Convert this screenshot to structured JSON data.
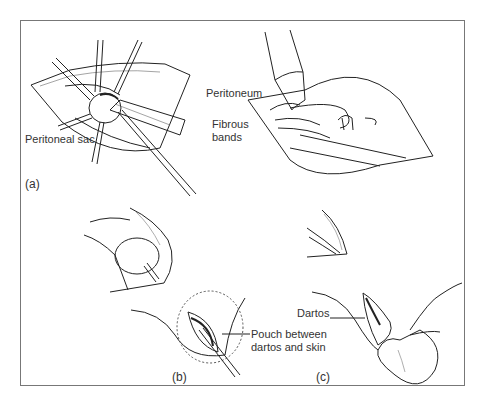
{
  "figure": {
    "panels": [
      {
        "id": "a",
        "label": "(a)"
      },
      {
        "id": "b",
        "label": "(b)"
      },
      {
        "id": "c",
        "label": "(c)"
      }
    ],
    "annotations": {
      "peritoneal_sac": "Peritoneal sac",
      "peritoneum": "Peritoneum",
      "fibrous_bands_1": "Fibrous",
      "fibrous_bands_2": "bands",
      "pouch_1": "Pouch between",
      "pouch_2": "dartos and skin",
      "dartos": "Dartos"
    },
    "colors": {
      "line": "#222222",
      "frame": "#777777",
      "text": "#333333"
    }
  }
}
